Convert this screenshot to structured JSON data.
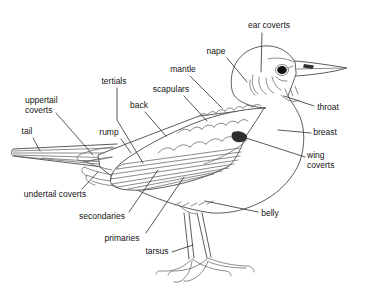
{
  "canvas": {
    "width": 366,
    "height": 307,
    "background": "#ffffff",
    "line_color": "#4a4a4a",
    "leader_color": "#3a3a3a",
    "text_color": "#141414"
  },
  "diagram": {
    "type": "labeled-diagram",
    "labels": [
      {
        "id": "ear-coverts",
        "text": "ear coverts",
        "x": 269,
        "y": 26,
        "align": "center",
        "leader": [
          [
            262,
            33
          ],
          [
            261,
            72
          ]
        ]
      },
      {
        "id": "nape",
        "text": "nape",
        "x": 216,
        "y": 52,
        "align": "center",
        "leader": [
          [
            227,
            58
          ],
          [
            247,
            82
          ]
        ]
      },
      {
        "id": "mantle",
        "text": "mantle",
        "x": 183,
        "y": 70,
        "align": "center",
        "leader": [
          [
            190,
            76
          ],
          [
            222,
            108
          ]
        ]
      },
      {
        "id": "scapulars",
        "text": "scapulars",
        "x": 171,
        "y": 90,
        "align": "center",
        "leader": [
          [
            184,
            96
          ],
          [
            207,
            121
          ]
        ]
      },
      {
        "id": "tertials",
        "text": "tertials",
        "x": 114,
        "y": 82,
        "align": "center",
        "leader": [
          [
            117,
            88
          ],
          [
            117,
            120
          ],
          [
            143,
            163
          ]
        ]
      },
      {
        "id": "back",
        "text": "back",
        "x": 139,
        "y": 106,
        "align": "center",
        "leader": [
          [
            145,
            112
          ],
          [
            166,
            136
          ]
        ]
      },
      {
        "id": "uppertail-coverts",
        "text": "uppertail\ncoverts",
        "x": 25,
        "y": 96,
        "align": "left",
        "leader": [
          [
            56,
            113
          ],
          [
            93,
            155
          ]
        ]
      },
      {
        "id": "tail",
        "text": "tail",
        "x": 27,
        "y": 132,
        "align": "center",
        "leader": [
          [
            33,
            138
          ],
          [
            40,
            151
          ]
        ]
      },
      {
        "id": "rump",
        "text": "rump",
        "x": 109,
        "y": 133,
        "align": "center",
        "leader": [
          [
            121,
            139
          ],
          [
            131,
            153
          ]
        ]
      },
      {
        "id": "undertail-coverts",
        "text": "undertail coverts",
        "x": 55,
        "y": 195,
        "align": "center",
        "leader": [
          [
            82,
            189
          ],
          [
            98,
            172
          ]
        ]
      },
      {
        "id": "secondaries",
        "text": "secondaries",
        "x": 102,
        "y": 217,
        "align": "center",
        "leader": [
          [
            129,
            212
          ],
          [
            158,
            170
          ]
        ]
      },
      {
        "id": "primaries",
        "text": "primaries",
        "x": 122,
        "y": 239,
        "align": "center",
        "leader": [
          [
            146,
            233
          ],
          [
            184,
            177
          ]
        ]
      },
      {
        "id": "tarsus",
        "text": "tarsus",
        "x": 157,
        "y": 252,
        "align": "center",
        "leader": [
          [
            172,
            252
          ],
          [
            193,
            245
          ]
        ]
      },
      {
        "id": "wing-coverts",
        "text": "wing\ncoverts",
        "x": 307,
        "y": 151,
        "align": "left",
        "leader": [
          [
            305,
            157
          ],
          [
            243,
            137
          ]
        ]
      },
      {
        "id": "throat",
        "text": "throat",
        "x": 328,
        "y": 108,
        "align": "center",
        "leader": [
          [
            314,
            106
          ],
          [
            284,
            96
          ]
        ]
      },
      {
        "id": "breast",
        "text": "breast",
        "x": 325,
        "y": 133,
        "align": "center",
        "leader": [
          [
            311,
            133
          ],
          [
            278,
            130
          ]
        ]
      },
      {
        "id": "belly",
        "text": "belly",
        "x": 270,
        "y": 214,
        "align": "center",
        "leader": [
          [
            258,
            212
          ],
          [
            205,
            201
          ]
        ]
      }
    ]
  }
}
